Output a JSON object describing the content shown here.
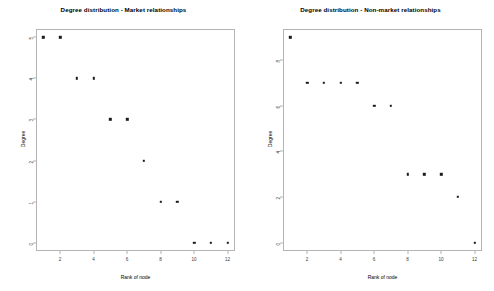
{
  "figure": {
    "background_color": "#ffffff",
    "axis_color": "#b4b4b4",
    "point_color": "#1a1a1a",
    "text_color": "#000000"
  },
  "chart_data": [
    {
      "type": "scatter",
      "title": "Degree distribution - Market relationships",
      "xlabel": "Rank of node",
      "ylabel": "Degree",
      "x": [
        1,
        2,
        3,
        4,
        5,
        6,
        7,
        8,
        9,
        10,
        11,
        12
      ],
      "values": [
        5,
        5,
        4,
        4,
        3,
        3,
        2,
        1,
        1,
        0,
        0,
        0
      ],
      "xlim": [
        0.56,
        12.44
      ],
      "ylim": [
        -0.2,
        5.2
      ],
      "xticks": [
        2,
        4,
        6,
        8,
        10,
        12
      ],
      "xtick_labels": [
        "2",
        "4",
        "6",
        "8",
        "10",
        "12"
      ],
      "yticks": [
        0,
        1,
        2,
        3,
        4,
        5
      ],
      "ytick_labels": [
        "0",
        "1",
        "2",
        "3",
        "4",
        "5"
      ],
      "grid": false,
      "legend": false
    },
    {
      "type": "scatter",
      "title": "Degree distribution - Non-market relationships",
      "xlabel": "Rank of node",
      "ylabel": "Degree",
      "x": [
        1,
        2,
        3,
        4,
        5,
        6,
        7,
        8,
        9,
        10,
        11,
        12
      ],
      "values": [
        9,
        7,
        7,
        7,
        7,
        6,
        6,
        3,
        3,
        3,
        2,
        0
      ],
      "xlim": [
        0.56,
        12.44
      ],
      "ylim": [
        -0.36,
        9.36
      ],
      "xticks": [
        2,
        4,
        6,
        8,
        10,
        12
      ],
      "xtick_labels": [
        "2",
        "4",
        "6",
        "8",
        "10",
        "12"
      ],
      "yticks": [
        0,
        2,
        4,
        6,
        8
      ],
      "ytick_labels": [
        "0",
        "2",
        "4",
        "6",
        "8"
      ],
      "grid": false,
      "legend": false
    }
  ]
}
